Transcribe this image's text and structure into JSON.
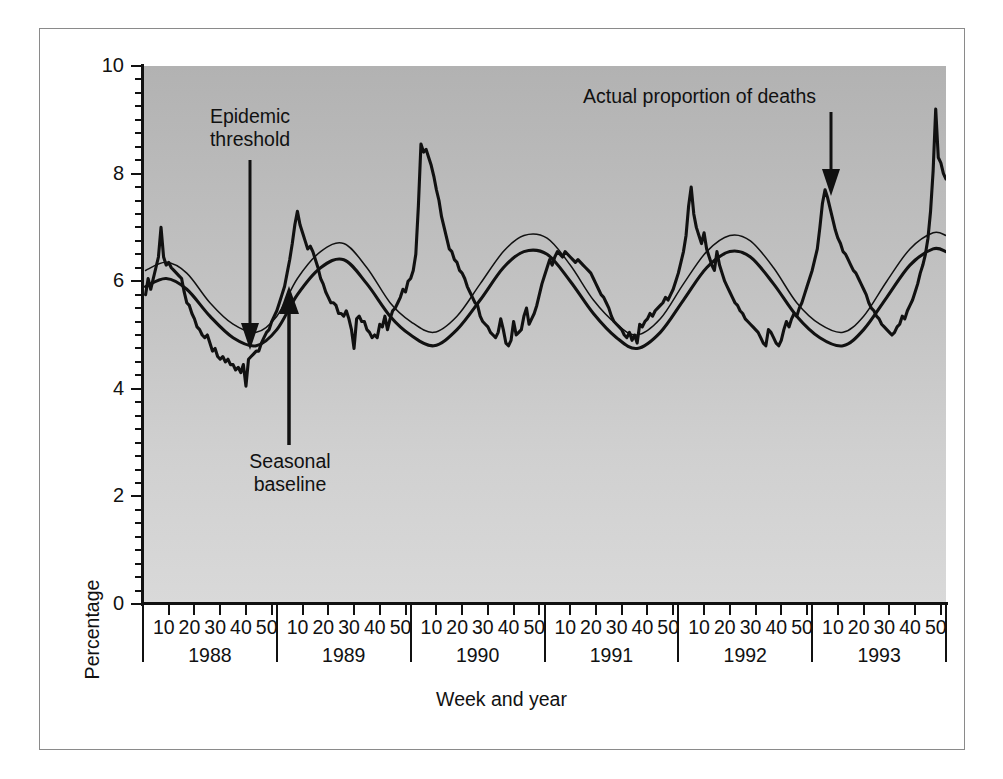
{
  "figure": {
    "background_color": "#ffffff",
    "plot_bg_top": "#b2b2b2",
    "plot_bg_bottom": "#d9d9d9",
    "line_color": "#111111"
  },
  "axes": {
    "y_title": "Percentage",
    "x_title": "Week and year",
    "y_ticks": [
      "0",
      "2",
      "4",
      "6",
      "8",
      "10"
    ],
    "y_tick_values": [
      0,
      2,
      4,
      6,
      8,
      10
    ],
    "y_minor_step": 0.25,
    "week_ticks": [
      "10",
      "20",
      "30",
      "40",
      "50"
    ],
    "years": [
      "1988",
      "1989",
      "1990",
      "1991",
      "1992",
      "1993"
    ]
  },
  "annotations": {
    "epidemic_threshold": "Epidemic\nthreshold",
    "epidemic_threshold_line1": "Epidemic",
    "epidemic_threshold_line2": "threshold",
    "seasonal_baseline_line1": "Seasonal",
    "seasonal_baseline_line2": "baseline",
    "actual_proportion": "Actual proportion of deaths"
  },
  "chart_data": {
    "type": "line",
    "title": "",
    "xlabel": "Week and year",
    "ylabel": "Percentage",
    "xlim": [
      0,
      312
    ],
    "ylim": [
      0,
      10
    ],
    "grid": false,
    "legend": "annotations",
    "x_unit": "week number (continuous, 52 weeks per year starting 1988 week 1)",
    "series": [
      {
        "name": "Actual proportion of deaths",
        "style": "thick jagged weekly line",
        "x": [
          1,
          2,
          3,
          4,
          5,
          6,
          7,
          8,
          9,
          10,
          11,
          12,
          13,
          14,
          15,
          16,
          17,
          18,
          19,
          20,
          21,
          22,
          23,
          24,
          25,
          26,
          27,
          28,
          29,
          30,
          31,
          32,
          33,
          34,
          35,
          36,
          37,
          38,
          39,
          40,
          41,
          42,
          43,
          44,
          45,
          46,
          47,
          48,
          49,
          50,
          51,
          52,
          53,
          54,
          55,
          56,
          57,
          58,
          59,
          60,
          61,
          62,
          63,
          64,
          65,
          66,
          67,
          68,
          69,
          70,
          71,
          72,
          73,
          74,
          75,
          76,
          77,
          78,
          79,
          80,
          81,
          82,
          83,
          84,
          85,
          86,
          87,
          88,
          89,
          90,
          91,
          92,
          93,
          94,
          95,
          96,
          97,
          98,
          99,
          100,
          101,
          102,
          103,
          104,
          105,
          106,
          107,
          108,
          109,
          110,
          111,
          112,
          113,
          114,
          115,
          116,
          117,
          118,
          119,
          120,
          121,
          122,
          123,
          124,
          125,
          126,
          127,
          128,
          129,
          130,
          131,
          132,
          133,
          134,
          135,
          136,
          137,
          138,
          139,
          140,
          141,
          142,
          143,
          144,
          145,
          146,
          147,
          148,
          149,
          150,
          151,
          152,
          153,
          154,
          155,
          156,
          157,
          158,
          159,
          160,
          161,
          162,
          163,
          164,
          165,
          166,
          167,
          168,
          169,
          170,
          171,
          172,
          173,
          174,
          175,
          176,
          177,
          178,
          179,
          180,
          181,
          182,
          183,
          184,
          185,
          186,
          187,
          188,
          189,
          190,
          191,
          192,
          193,
          194,
          195,
          196,
          197,
          198,
          199,
          200,
          201,
          202,
          203,
          204,
          205,
          206,
          207,
          208,
          209,
          210,
          211,
          212,
          213,
          214,
          215,
          216,
          217,
          218,
          219,
          220,
          221,
          222,
          223,
          224,
          225,
          226,
          227,
          228,
          229,
          230,
          231,
          232,
          233,
          234,
          235,
          236,
          237,
          238,
          239,
          240,
          241,
          242,
          243,
          244,
          245,
          246,
          247,
          248,
          249,
          250,
          251,
          252,
          253,
          254,
          255,
          256,
          257,
          258,
          259,
          260,
          261,
          262,
          263,
          264,
          265,
          266,
          267,
          268,
          269,
          270,
          271,
          272,
          273,
          274,
          275,
          276,
          277,
          278,
          279,
          280,
          281,
          282,
          283,
          284,
          285,
          286,
          287,
          288,
          289,
          290,
          291,
          292,
          293,
          294,
          295,
          296,
          297,
          298,
          299,
          300,
          301,
          302,
          303,
          304,
          305,
          306,
          307,
          308,
          309,
          310,
          311,
          312
        ],
        "y": [
          5.75,
          6.05,
          5.85,
          6.05,
          6.25,
          6.45,
          7.0,
          6.45,
          6.3,
          6.35,
          6.25,
          6.2,
          6.15,
          6.1,
          6.05,
          5.8,
          5.6,
          5.55,
          5.4,
          5.3,
          5.15,
          5.1,
          5.0,
          4.95,
          5.0,
          4.85,
          4.7,
          4.75,
          4.6,
          4.55,
          4.6,
          4.5,
          4.55,
          4.45,
          4.45,
          4.35,
          4.4,
          4.3,
          4.45,
          4.05,
          4.55,
          4.6,
          4.65,
          4.7,
          4.7,
          4.85,
          4.95,
          5.05,
          5.1,
          5.25,
          5.35,
          5.45,
          5.6,
          5.75,
          5.9,
          6.15,
          6.4,
          6.7,
          7.05,
          7.3,
          7.05,
          6.9,
          6.75,
          6.6,
          6.65,
          6.55,
          6.4,
          6.25,
          6.05,
          5.95,
          5.8,
          5.7,
          5.6,
          5.6,
          5.55,
          5.4,
          5.4,
          5.35,
          5.45,
          5.3,
          5.1,
          4.75,
          5.3,
          5.35,
          5.25,
          5.25,
          5.1,
          5.05,
          4.95,
          5.0,
          4.95,
          5.2,
          5.15,
          5.35,
          5.1,
          5.3,
          5.45,
          5.5,
          5.6,
          5.7,
          5.85,
          5.8,
          6.0,
          6.05,
          6.2,
          6.5,
          7.4,
          8.55,
          8.4,
          8.45,
          8.3,
          8.15,
          7.95,
          7.7,
          7.5,
          7.2,
          7.0,
          6.8,
          6.6,
          6.55,
          6.4,
          6.35,
          6.2,
          6.15,
          6.05,
          5.9,
          5.8,
          5.7,
          5.6,
          5.55,
          5.35,
          5.25,
          5.2,
          5.15,
          5.05,
          5.0,
          4.95,
          5.05,
          5.3,
          5.1,
          4.85,
          4.8,
          4.9,
          5.25,
          5.0,
          5.05,
          5.1,
          5.35,
          5.5,
          5.2,
          5.3,
          5.4,
          5.55,
          5.75,
          5.95,
          6.1,
          6.25,
          6.4,
          6.3,
          6.45,
          6.55,
          6.5,
          6.45,
          6.55,
          6.5,
          6.45,
          6.4,
          6.35,
          6.4,
          6.35,
          6.3,
          6.25,
          6.2,
          6.15,
          6.05,
          5.95,
          5.85,
          5.75,
          5.7,
          5.6,
          5.5,
          5.35,
          5.25,
          5.2,
          5.15,
          5.1,
          5.0,
          4.95,
          5.05,
          4.9,
          5.0,
          4.85,
          5.2,
          5.15,
          5.25,
          5.3,
          5.4,
          5.35,
          5.45,
          5.5,
          5.55,
          5.6,
          5.7,
          5.65,
          5.75,
          5.85,
          6.0,
          6.15,
          6.35,
          6.55,
          6.85,
          7.4,
          7.75,
          7.25,
          7.0,
          6.85,
          6.7,
          6.9,
          6.6,
          6.45,
          6.3,
          6.2,
          6.55,
          6.3,
          6.15,
          6.0,
          5.9,
          5.8,
          5.7,
          5.6,
          5.55,
          5.45,
          5.4,
          5.3,
          5.25,
          5.2,
          5.15,
          5.1,
          5.05,
          4.95,
          4.85,
          4.8,
          5.1,
          5.05,
          4.95,
          4.85,
          4.8,
          4.9,
          5.1,
          5.25,
          5.15,
          5.3,
          5.4,
          5.35,
          5.5,
          5.6,
          5.75,
          5.9,
          6.05,
          6.2,
          6.4,
          6.6,
          7.0,
          7.45,
          7.7,
          7.55,
          7.35,
          7.15,
          6.95,
          6.8,
          6.7,
          6.55,
          6.5,
          6.4,
          6.3,
          6.2,
          6.15,
          6.05,
          5.95,
          5.85,
          5.75,
          5.6,
          5.5,
          5.45,
          5.35,
          5.3,
          5.2,
          5.15,
          5.1,
          5.05,
          5.0,
          5.05,
          5.15,
          5.2,
          5.35,
          5.3,
          5.45,
          5.55,
          5.65,
          5.8,
          5.95,
          6.15,
          6.3,
          6.5,
          6.8,
          7.3,
          8.05,
          9.2,
          8.3,
          8.2,
          8.0,
          7.9
        ],
        "key_features": {
          "1988_early_spike": 7.0,
          "1988_summer_min": 4.05,
          "1989_winter_peak": 7.3,
          "1990_winter_peak": 8.55,
          "1991_winter_peak": 6.55,
          "1992_winter_peak": 7.75,
          "1993_winter_peak": 7.7,
          "1993_end_spike": 9.2
        }
      },
      {
        "name": "Epidemic threshold",
        "style": "thin smooth line",
        "x": [
          1,
          9,
          17,
          26,
          35,
          44,
          52,
          60,
          69,
          78,
          87,
          96,
          104,
          113,
          122,
          131,
          140,
          148,
          157,
          166,
          175,
          184,
          192,
          201,
          210,
          219,
          228,
          236,
          245,
          254,
          263,
          272,
          280,
          289,
          298,
          307,
          312
        ],
        "y": [
          6.2,
          6.35,
          6.15,
          5.6,
          5.2,
          5.05,
          5.35,
          6.05,
          6.55,
          6.7,
          6.25,
          5.6,
          5.25,
          5.05,
          5.35,
          5.95,
          6.55,
          6.85,
          6.8,
          6.3,
          5.65,
          5.2,
          5.0,
          5.3,
          5.95,
          6.55,
          6.85,
          6.75,
          6.25,
          5.6,
          5.2,
          5.05,
          5.35,
          6.0,
          6.6,
          6.9,
          6.85
        ]
      },
      {
        "name": "Seasonal baseline",
        "style": "thick smooth line",
        "x": [
          1,
          9,
          17,
          26,
          35,
          44,
          52,
          60,
          69,
          78,
          87,
          96,
          104,
          113,
          122,
          131,
          140,
          148,
          157,
          166,
          175,
          184,
          192,
          201,
          210,
          219,
          228,
          236,
          245,
          254,
          263,
          272,
          280,
          289,
          298,
          307,
          312
        ],
        "y": [
          5.9,
          6.05,
          5.85,
          5.35,
          4.95,
          4.8,
          5.1,
          5.75,
          6.25,
          6.4,
          5.95,
          5.35,
          5.0,
          4.8,
          5.1,
          5.65,
          6.25,
          6.55,
          6.5,
          6.0,
          5.4,
          4.95,
          4.75,
          5.05,
          5.65,
          6.25,
          6.55,
          6.45,
          5.95,
          5.35,
          4.95,
          4.8,
          5.1,
          5.7,
          6.3,
          6.6,
          6.55
        ]
      }
    ]
  }
}
